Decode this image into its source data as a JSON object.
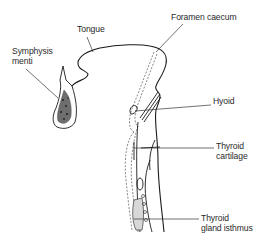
{
  "diagram": {
    "type": "anatomical-line-drawing",
    "line_color": "#1a1a1a",
    "leader_color": "#333333",
    "labels": {
      "tongue": [
        "Tongue"
      ],
      "foramen_caecum": [
        "Foramen caecum"
      ],
      "symphysis_menti": [
        "Symphysis",
        "menti"
      ],
      "hyoid": [
        "Hyoid"
      ],
      "thyroid_cartilage": [
        "Thyroid",
        "cartilage"
      ],
      "thyroid_gland_isthmus": [
        "Thyroid",
        "gland isthmus"
      ]
    }
  }
}
